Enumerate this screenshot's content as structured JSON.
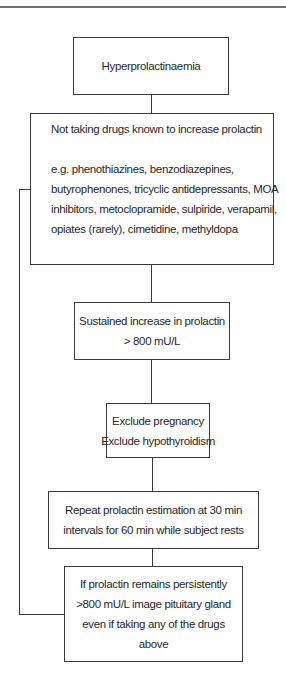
{
  "diagram": {
    "type": "flowchart",
    "boxes": [
      {
        "id": "hyperprolactinaemia",
        "lines": [
          "Hyperprolactinaemia"
        ]
      },
      {
        "id": "no-drugs",
        "heading": "Not taking drugs known to increase prolactin",
        "lines": [
          "e.g.  phenothiazines, benzodiazepines,",
          "butyrophenones, tricyclic antidepressants, MOA",
          "inhibitors, metoclopramide, sulpiride, verapamil,",
          "opiates (rarely), cimetidine, methyldopa"
        ]
      },
      {
        "id": "sustained-increase",
        "lines": [
          "Sustained increase in prolactin",
          "> 800 mU/L"
        ]
      },
      {
        "id": "exclusions",
        "lines": [
          "Exclude pregnancy",
          "Exclude hypothyroidism"
        ]
      },
      {
        "id": "repeat-estimation",
        "lines": [
          "Repeat prolactin estimation at 30 min",
          "intervals for 60 min while subject rests"
        ]
      },
      {
        "id": "image-pituitary",
        "lines": [
          "If prolactin remains persistently",
          ">800 mU/L image pituitary gland",
          "even if taking any of the drugs",
          "above"
        ]
      }
    ],
    "edges": [
      {
        "from": "hyperprolactinaemia",
        "to": "no-drugs"
      },
      {
        "from": "no-drugs",
        "to": "sustained-increase"
      },
      {
        "from": "sustained-increase",
        "to": "exclusions"
      },
      {
        "from": "exclusions",
        "to": "repeat-estimation"
      },
      {
        "from": "repeat-estimation",
        "to": "image-pituitary"
      },
      {
        "from": "no-drugs",
        "to": "image-pituitary",
        "route": "left-bypass"
      }
    ],
    "colors": {
      "line": "#3a3a3a",
      "text": "#2a2a2a",
      "rule": "#6e6e6e",
      "background": "#ffffff"
    }
  }
}
